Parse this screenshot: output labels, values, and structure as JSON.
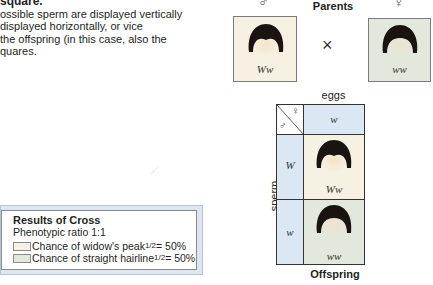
{
  "intro": {
    "title": "square.",
    "lines": [
      "ossible sperm are displayed vertically",
      " displayed horizontally, or vice",
      "the offspring (in this case, also the",
      "quares."
    ]
  },
  "parents": {
    "label": "Parents",
    "male_symbol": "♂",
    "female_symbol": "♀",
    "cross_symbol": "×",
    "male": {
      "genotype": "Ww",
      "phenotype": "widow's peak",
      "bg_color": "#f6f1e2"
    },
    "female": {
      "genotype": "ww",
      "phenotype": "straight hairline",
      "bg_color": "#e3e8dc"
    }
  },
  "punnett": {
    "eggs_label": "eggs",
    "sperm_label": "sperm",
    "corner_female": "♀",
    "corner_male": "♂",
    "egg_alleles": [
      "w"
    ],
    "sperm_alleles": [
      "W",
      "w"
    ],
    "offspring": [
      {
        "genotype": "Ww",
        "phenotype": "widow's peak",
        "bg_color": "#f6f1e2"
      },
      {
        "genotype": "ww",
        "phenotype": "straight hairline",
        "bg_color": "#e3e8dc"
      }
    ],
    "header_color": "#dbe8f4",
    "offspring_label": "Offspring"
  },
  "results": {
    "title": "Results of Cross",
    "ratio": "Phenotypic ratio 1:1",
    "items": [
      {
        "text": "Chance of widow's peak ",
        "fraction": "1/2",
        "percent": " = 50%",
        "color": "#f6f1e2"
      },
      {
        "text": "Chance of straight hairline ",
        "fraction": "1/2",
        "percent": " = 50%",
        "color": "#e3e8dc"
      }
    ]
  }
}
